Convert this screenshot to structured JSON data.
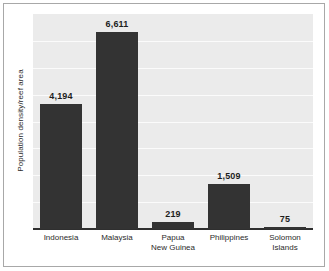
{
  "chart_data": {
    "type": "bar",
    "title": "",
    "subtitle": "",
    "xlabel": "",
    "ylabel": "Population density/reef area",
    "categories": [
      "Indonesia",
      "Malaysia",
      "Papua New Guinea",
      "Philippines",
      "Solomon Islands"
    ],
    "category_lines": [
      [
        "Indonesia"
      ],
      [
        "Malaysia"
      ],
      [
        "Papua",
        "New Guinea"
      ],
      [
        "Philippines"
      ],
      [
        "Solomon",
        "Islands"
      ]
    ],
    "values": [
      4194,
      6611,
      219,
      1509,
      75
    ],
    "value_labels": [
      "4,194",
      "6,611",
      "219",
      "1,509",
      "75"
    ],
    "ylim": [
      0,
      7200
    ],
    "grid": true,
    "gridlines": [
      900,
      1800,
      2700,
      3600,
      4500,
      5400,
      6300
    ],
    "legend": "none",
    "axis_tick_labels": [],
    "series": [
      {
        "name": "Population density/reef area",
        "values": [
          4194,
          6611,
          219,
          1509,
          75
        ]
      }
    ]
  },
  "style": {
    "bar_color": "#333333",
    "plot_background": "#ebebeb",
    "gridline_color": "#fbfbfb",
    "axis_color": "#2f2f2f",
    "frame_color": "#a8a8a8",
    "page_background": "#ffffff",
    "text_color": "#2b2b2b"
  }
}
